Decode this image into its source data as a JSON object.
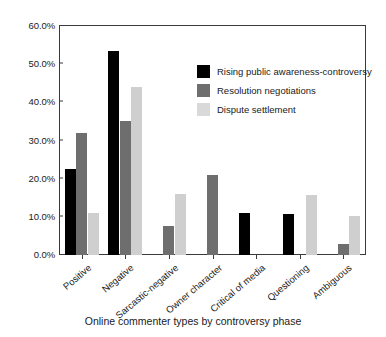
{
  "chart_data": {
    "type": "bar",
    "title": "",
    "xlabel": "Online commenter types by controversy phase",
    "ylabel": "",
    "ylim": [
      0,
      60
    ],
    "ytick_labels": [
      "0.0%",
      "10.0%",
      "20.0%",
      "30.0%",
      "40.0%",
      "50.0%",
      "60.0%"
    ],
    "ytick_values": [
      0,
      10,
      20,
      30,
      40,
      50,
      60
    ],
    "grid": false,
    "legend_position": "upper-right-inside",
    "categories": [
      "Positive",
      "Negative",
      "Sarcastic-negative",
      "Owner character",
      "Critical of media",
      "Questioning",
      "Ambiguous"
    ],
    "series": [
      {
        "name": "Rising public awareness-controversy",
        "color": "#000000",
        "values": [
          22.5,
          53.5,
          0,
          0,
          11.0,
          10.7,
          0
        ]
      },
      {
        "name": "Resolution negotiations",
        "color": "#6e6e6e",
        "values": [
          32.0,
          35.0,
          7.5,
          21.0,
          0,
          0,
          3.0
        ]
      },
      {
        "name": "Dispute settlement",
        "color": "#cfcfcf",
        "values": [
          11.0,
          44.0,
          16.0,
          0,
          0,
          15.7,
          10.3
        ]
      }
    ]
  }
}
